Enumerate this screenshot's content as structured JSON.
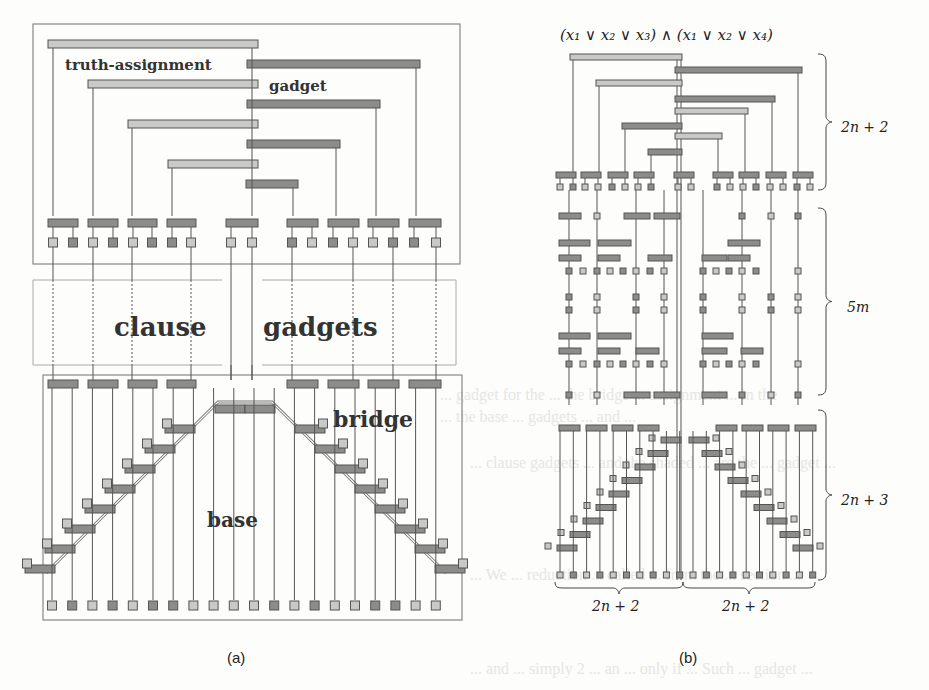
{
  "figure": {
    "panel_a": {
      "caption": "(a)",
      "labels": {
        "truth_assignment": "truth-assignment",
        "gadget": "gadget",
        "clause": "clause",
        "gadgets": "gadgets",
        "bridge": "bridge",
        "base": "base"
      }
    },
    "panel_b": {
      "caption": "(b)",
      "formula": "(x₁ ∨ x₂ ∨ x₃) ∧ (x₁ ∨ x₂ ∨ x₄)",
      "brace_labels": {
        "top": "2n + 2",
        "middle": "5m",
        "bottom": "2n + 3",
        "bottom_left": "2n + 2",
        "bottom_right": "2n + 2"
      }
    },
    "colors": {
      "light_fill": "#c9c9c7",
      "dark_fill": "#8c8c8a",
      "stroke": "#555555",
      "box": "#888888"
    }
  },
  "bleed_through": [
    {
      "text": "... gadget for the ... the bridge ... assignment ... in the",
      "x": 440,
      "y": 396
    },
    {
      "text": "... the base ... gadgets ... and ...",
      "x": 440,
      "y": 418
    },
    {
      "text": "... clause gadgets ... and the shaded ... are the ... gadget ...",
      "x": 40,
      "y": 464
    },
    {
      "text": "... We ... reduction ... called ... from the ... section ...",
      "x": 40,
      "y": 486
    },
    {
      "text": "... and ... simply 2 ... an ... only if ... Such ... gadget ... ",
      "x": 40,
      "y": 508
    }
  ]
}
